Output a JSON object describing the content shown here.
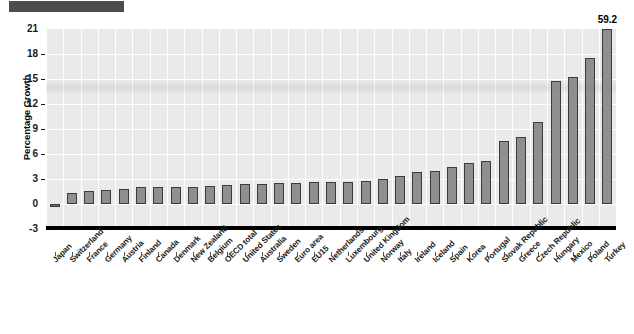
{
  "header": {
    "block_color": "#4d4d4d"
  },
  "chart_data": {
    "type": "bar",
    "title": "",
    "xlabel": "",
    "ylabel": "Percentage Growth",
    "ylim": [
      -3,
      21
    ],
    "yticks": [
      -3,
      0,
      3,
      6,
      9,
      12,
      15,
      18,
      21
    ],
    "ytick_labels": [
      "-3",
      "0",
      "3",
      "6",
      "9",
      "12",
      "15",
      "18",
      "21"
    ],
    "grid": true,
    "legend": null,
    "bar_color": "#8f8f8f",
    "bar_edge_color": "#3b3b3b",
    "plot_background": "#eaeaea",
    "gridline_color": "#ffffff",
    "zero_line_color": "#000000",
    "annotations": [
      {
        "category": "Turkey",
        "text": "59.2",
        "note": "bar clipped at axis top"
      }
    ],
    "categories": [
      "Japan",
      "Switzerland",
      "France",
      "Germany",
      "Austria",
      "Finland",
      "Canada",
      "Denmark",
      "New Zealand",
      "Belgium",
      "OECD total",
      "United States",
      "Australia",
      "Sweden",
      "Euro area",
      "EU15",
      "Netherlands",
      "Luxembourg",
      "United Kingdom",
      "Norway",
      "Italy",
      "Ireland",
      "Iceland",
      "Spain",
      "Korea",
      "Portugal",
      "Slovak Republic",
      "Greece",
      "Czech Republic",
      "Hungary",
      "Mexico",
      "Poland",
      "Turkey"
    ],
    "values": [
      -0.4,
      1.3,
      1.6,
      1.7,
      1.8,
      2.0,
      2.1,
      2.1,
      2.1,
      2.2,
      2.3,
      2.4,
      2.4,
      2.5,
      2.5,
      2.6,
      2.6,
      2.7,
      2.8,
      3.0,
      3.4,
      3.9,
      4.0,
      4.5,
      4.9,
      5.2,
      7.6,
      8.0,
      9.9,
      14.8,
      15.2,
      17.5,
      59.2
    ]
  }
}
